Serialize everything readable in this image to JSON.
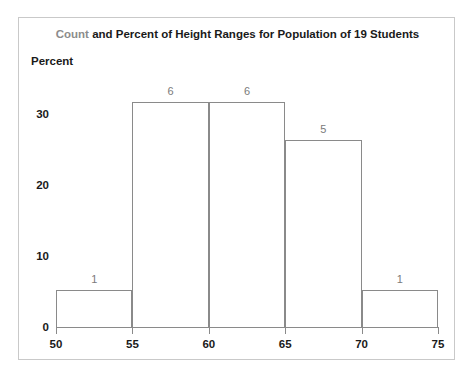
{
  "chart_data": {
    "type": "bar",
    "title": "Count and Percent of Height Ranges for Population of 19 Students",
    "title_parts": {
      "highlight": "Count",
      "rest": " and Percent of Height Ranges for Population of 19 Students"
    },
    "title_highlight_color": "#8c8c8c",
    "xlabel": "",
    "ylabel": "Percent",
    "ylim": [
      0,
      35
    ],
    "xlim": [
      50,
      75
    ],
    "grid": false,
    "legend": null,
    "y_ticks": [
      0,
      10,
      20,
      30
    ],
    "x_ticks": [
      50,
      55,
      60,
      65,
      70,
      75
    ],
    "bin_edges": [
      50,
      55,
      60,
      65,
      70,
      75
    ],
    "categories": [
      "50-55",
      "55-60",
      "60-65",
      "65-70",
      "70-75"
    ],
    "counts": [
      1,
      6,
      6,
      5,
      1
    ],
    "values": [
      5.26,
      31.58,
      31.58,
      26.32,
      5.26
    ],
    "data_labels": [
      "1",
      "6",
      "6",
      "5",
      "1"
    ],
    "total_count": 19,
    "bar_fill": "#ffffff",
    "bar_edge_color": "#8a8a8a",
    "axis_color": "#8a8a8a",
    "text_color": "#1a1a1a",
    "data_label_color": "#7a7a7a",
    "frame_border_color": "#c9c9c9"
  }
}
